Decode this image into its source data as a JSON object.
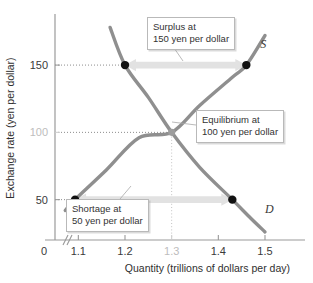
{
  "chart_data": {
    "type": "line",
    "title": "",
    "xlabel": "Quantity (trillions of dollars per day)",
    "ylabel": "Exchange rate (yen per dollar)",
    "xlim": [
      1.05,
      1.56
    ],
    "ylim": [
      20,
      185
    ],
    "xticks": [
      "1.1",
      "1.2",
      "1.3",
      "1.4",
      "1.5"
    ],
    "xtick_values": [
      1.1,
      1.2,
      1.3,
      1.4,
      1.5
    ],
    "yticks": [
      "150",
      "100",
      "50"
    ],
    "ytick_values": [
      150,
      100,
      50
    ],
    "origin_label": "0",
    "axis_break": true,
    "grid": false,
    "legend": "inline-curve-labels",
    "series": [
      {
        "name": "Supply of dollars",
        "label": "S",
        "label_x": 1.49,
        "label_y": 163,
        "points": [
          {
            "x": 1.072,
            "y": 42
          },
          {
            "x": 1.093,
            "y": 50
          },
          {
            "x": 1.16,
            "y": 72
          },
          {
            "x": 1.23,
            "y": 96
          },
          {
            "x": 1.3,
            "y": 100
          },
          {
            "x": 1.36,
            "y": 120
          },
          {
            "x": 1.43,
            "y": 141
          },
          {
            "x": 1.46,
            "y": 150
          },
          {
            "x": 1.5,
            "y": 172
          }
        ]
      },
      {
        "name": "Demand for dollars",
        "label": "D",
        "label_x": 1.5,
        "label_y": 40,
        "points": [
          {
            "x": 1.168,
            "y": 178
          },
          {
            "x": 1.2,
            "y": 150
          },
          {
            "x": 1.25,
            "y": 126
          },
          {
            "x": 1.3,
            "y": 100
          },
          {
            "x": 1.36,
            "y": 74
          },
          {
            "x": 1.43,
            "y": 50
          },
          {
            "x": 1.47,
            "y": 36
          },
          {
            "x": 1.5,
            "y": 26
          }
        ]
      }
    ],
    "markers": [
      {
        "name": "demand-at-150",
        "x": 1.2,
        "y": 150,
        "style": "solid"
      },
      {
        "name": "supply-at-150",
        "x": 1.46,
        "y": 150,
        "style": "solid"
      },
      {
        "name": "equilibrium",
        "x": 1.3,
        "y": 100,
        "style": "equilibrium"
      },
      {
        "name": "supply-at-50",
        "x": 1.093,
        "y": 50,
        "style": "solid"
      },
      {
        "name": "demand-at-50",
        "x": 1.43,
        "y": 50,
        "style": "solid"
      }
    ],
    "gap_arrows": [
      {
        "name": "surplus-arrow",
        "y": 150,
        "x_start": 1.2,
        "x_end": 1.46
      },
      {
        "name": "shortage-arrow",
        "y": 50,
        "x_start": 1.093,
        "x_end": 1.43
      }
    ],
    "guides": [
      {
        "name": "guide-150",
        "orientation": "horizontal",
        "value": 150,
        "from": 1.05,
        "to": 1.46
      },
      {
        "name": "guide-100",
        "orientation": "horizontal",
        "value": 100,
        "from": 1.05,
        "to": 1.3
      },
      {
        "name": "guide-50",
        "orientation": "horizontal",
        "value": 50,
        "from": 1.05,
        "to": 1.43
      },
      {
        "name": "guide-quantity-13",
        "orientation": "vertical",
        "value": 1.3,
        "from": 20,
        "to": 100
      }
    ],
    "annotations": [
      {
        "name": "surplus-callout",
        "lines": [
          "Surplus at",
          "150 yen per dollar"
        ],
        "box_left": 147,
        "box_top": 17,
        "leader": {
          "x1": 172,
          "y1": 45,
          "x2": 183,
          "y2": 61
        }
      },
      {
        "name": "equilibrium-callout",
        "lines": [
          "Equilibrium at",
          "100 yen per dollar"
        ],
        "box_left": 196,
        "box_top": 110,
        "leader": {
          "x1": 196,
          "y1": 125,
          "x2": 172,
          "y2": 122
        }
      },
      {
        "name": "shortage-callout",
        "lines": [
          "Shortage at",
          "50 yen per dollar"
        ],
        "box_left": 66,
        "box_top": 199,
        "leader": {
          "x1": 120,
          "y1": 199,
          "x2": 131,
          "y2": 186
        }
      }
    ],
    "colors": {
      "curve": "#8f8f8f",
      "marker": "#111111",
      "equilibrium_marker": "#9d9d9d",
      "arrow": "#e2e2e2",
      "axis": "#9a9a9a",
      "text": "#3a3a3a",
      "muted_text": "#bdbdbd",
      "callout_border": "#b9b9b9",
      "background": "#ffffff"
    }
  }
}
